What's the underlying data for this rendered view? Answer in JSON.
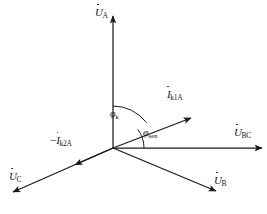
{
  "figure": {
    "type": "phasor-diagram",
    "background_color": "#ffffff",
    "line_color": "#1a1a1a",
    "origin": {
      "x": 113,
      "y": 148
    },
    "caption": ""
  },
  "phasors": [
    {
      "key": "u_a",
      "label_base": "U",
      "label_sub": "A",
      "label_prefix": "",
      "overdot": true,
      "angle_deg": 90,
      "tip": {
        "x": 113,
        "y": 16
      },
      "label_pos": {
        "x": 95,
        "y": 8
      },
      "arrow": "tip"
    },
    {
      "key": "u_bc",
      "label_base": "U",
      "label_sub": "BC",
      "label_prefix": "",
      "overdot": true,
      "angle_deg": 0,
      "tip": {
        "x": 262,
        "y": 148
      },
      "label_pos": {
        "x": 234,
        "y": 128
      },
      "arrow": "tip"
    },
    {
      "key": "i_k1a",
      "label_base": "I",
      "label_sub": "k1A",
      "label_prefix": "",
      "overdot": true,
      "angle_deg": 37,
      "tip": {
        "x": 191,
        "y": 118
      },
      "label_pos": {
        "x": 167,
        "y": 90
      },
      "arrow": "tip"
    },
    {
      "key": "u_b",
      "label_base": "U",
      "label_sub": "B",
      "label_prefix": "",
      "overdot": true,
      "angle_deg": -27,
      "tip": {
        "x": 216,
        "y": 191
      },
      "label_pos": {
        "x": 214,
        "y": 176
      },
      "arrow": "tip"
    },
    {
      "key": "u_c",
      "label_base": "U",
      "label_sub": "C",
      "label_prefix": "",
      "overdot": true,
      "angle_deg": 205,
      "tip": {
        "x": 13,
        "y": 192
      },
      "label_pos": {
        "x": 9,
        "y": 172
      },
      "arrow": "tip"
    },
    {
      "key": "minus_i_k2a",
      "label_base": "I",
      "label_sub": "k2A",
      "label_prefix": "−",
      "overdot": true,
      "angle_deg": 205,
      "tip": {
        "x": 78,
        "y": 164
      },
      "label_pos": {
        "x": 54,
        "y": 136
      },
      "arrow": "mid"
    }
  ],
  "angles": [
    {
      "key": "phi_k",
      "symbol": "φ",
      "sub": "k",
      "from_deg": 37,
      "to_deg": 90,
      "radius": 42,
      "label_pos": {
        "x": 110,
        "y": 110
      },
      "description": "angle between U_A and I_k1A"
    },
    {
      "key": "phi_sen",
      "symbol": "φ",
      "sub": "sen",
      "from_deg": 0,
      "to_deg": 37,
      "radius": 31,
      "label_pos": {
        "x": 143,
        "y": 129
      },
      "description": "angle between U_BC and I_k1A"
    }
  ]
}
